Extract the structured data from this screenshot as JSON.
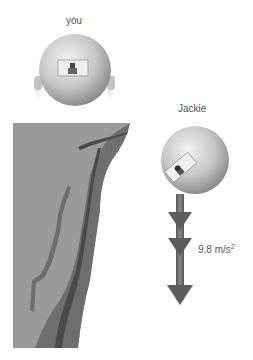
{
  "labels": {
    "you": "you",
    "jackie": "Jackie",
    "acceleration": "9.8 m/s",
    "acceleration_exp": "2"
  },
  "colors": {
    "cliff_light": "#9a9a9a",
    "cliff_mid": "#6e6e6e",
    "cliff_dark": "#4a4a4a",
    "arrow": "#6a6a6a",
    "sphere": "#c8c8c8"
  }
}
